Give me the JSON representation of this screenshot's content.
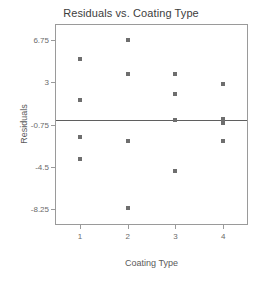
{
  "chart_data": {
    "type": "scatter",
    "title": "Residuals vs. Coating Type",
    "xlabel": "Coating Type",
    "ylabel": "Residuals",
    "grid": false,
    "legend": null,
    "xlim": [
      0.5,
      4.5
    ],
    "ylim": [
      -9.6,
      8.1
    ],
    "xticks": [
      "1",
      "2",
      "3",
      "4"
    ],
    "xtick_values": [
      1,
      2,
      3,
      4
    ],
    "yticks": [
      "6.75",
      "3",
      "-0.75",
      "-4.5",
      "-8.25"
    ],
    "ytick_values": [
      6.75,
      3,
      -0.75,
      -4.5,
      -8.25
    ],
    "reference_line": {
      "orientation": "horizontal",
      "value": -0.35,
      "color": "#5f5f5f"
    },
    "marker": {
      "shape": "square",
      "color": "#6e6e6e",
      "size": 4
    },
    "points": [
      {
        "x": 1,
        "y": 5.1
      },
      {
        "x": 1,
        "y": 1.4
      },
      {
        "x": 1,
        "y": -1.9
      },
      {
        "x": 1,
        "y": -3.8
      },
      {
        "x": 2,
        "y": 6.75
      },
      {
        "x": 2,
        "y": 3.7
      },
      {
        "x": 2,
        "y": -2.2
      },
      {
        "x": 2,
        "y": -8.2
      },
      {
        "x": 3,
        "y": 3.7
      },
      {
        "x": 3,
        "y": 1.95
      },
      {
        "x": 3,
        "y": -0.35
      },
      {
        "x": 3,
        "y": -4.9
      },
      {
        "x": 4,
        "y": 2.85
      },
      {
        "x": 4,
        "y": -0.3
      },
      {
        "x": 4,
        "y": -0.6
      },
      {
        "x": 4,
        "y": -2.2
      }
    ]
  }
}
